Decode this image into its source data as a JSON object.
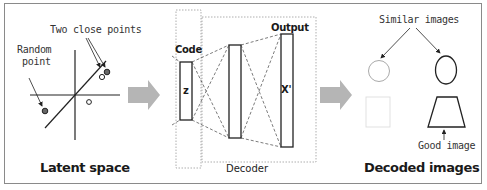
{
  "panels": {
    "latent": {
      "title": "Latent space",
      "annotations": {
        "close_points": "Two close points",
        "random_point_line1": "Random",
        "random_point_line2": "point"
      }
    },
    "decoder": {
      "title": "Decoder",
      "code_label": "Code",
      "output_label": "Output",
      "z_label": "z",
      "x_label": "X'"
    },
    "decoded": {
      "title": "Decoded images",
      "annotations": {
        "similar": "Similar images",
        "good": "Good image"
      }
    }
  },
  "colors": {
    "border": "#8a8a8a",
    "arrow": "#b5b5b5",
    "stroke": "#222222",
    "faint": "#c8c8c8"
  }
}
